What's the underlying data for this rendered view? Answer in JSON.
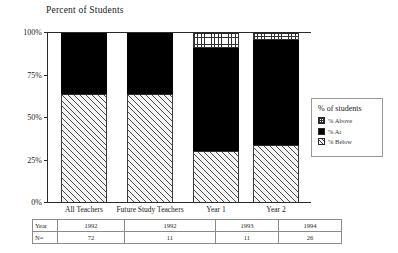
{
  "chart_data": {
    "type": "bar",
    "title": "Percent of Students",
    "xlabel": "",
    "ylabel": "",
    "ylim": [
      0,
      100
    ],
    "grid": false,
    "stacked": true,
    "legend_position": "right",
    "legend_title": "% of students",
    "categories": [
      "All Teachers",
      "Future Study Teachers",
      "Year 1",
      "Year 2"
    ],
    "tick_labels": [
      "0%",
      "25%",
      "50%",
      "75%",
      "100%"
    ],
    "tick_values": [
      0,
      25,
      50,
      75,
      100
    ],
    "series": [
      {
        "name": "% Above",
        "values": [
          0,
          0,
          9,
          4
        ]
      },
      {
        "name": "% At",
        "values": [
          36,
          36,
          61,
          62
        ]
      },
      {
        "name": "% Below",
        "values": [
          64,
          64,
          30,
          34
        ]
      }
    ],
    "table": {
      "row_labels": [
        "Year",
        "N="
      ],
      "rows": [
        [
          "1992",
          "1992",
          "1993",
          "1994"
        ],
        [
          "72",
          "11",
          "11",
          "26"
        ]
      ]
    }
  }
}
